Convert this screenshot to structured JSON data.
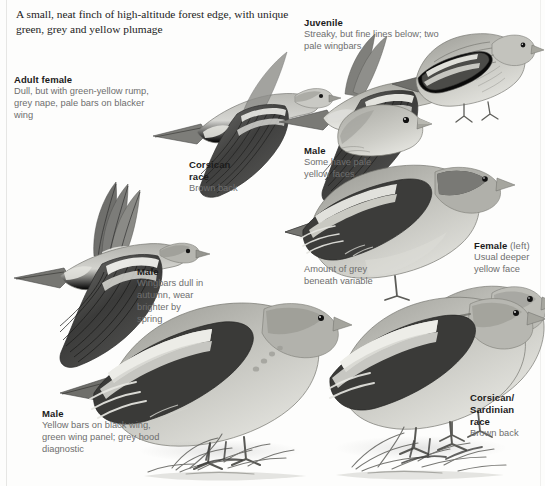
{
  "plate": {
    "title_note": "A small, neat finch of high-altitude forest edge, with unique green, grey and yellow plumage",
    "width": 545,
    "height": 486,
    "background_color": "#fdfdfc",
    "ink_color": "#4a4a4a",
    "label_heading_color": "#1b1b1b",
    "label_body_color": "#6e6e6e"
  },
  "labels": {
    "adult_female": {
      "heading": "Adult female",
      "body": "Dull, but with green-yellow rump, grey nape, pale bars on blacker wing"
    },
    "corsican_race_flight": {
      "heading": "Corsican race",
      "body": "Brown back"
    },
    "male_flight": {
      "heading": "Male",
      "body": "Wingbars dull in autumn, wear brighter by spring"
    },
    "juvenile": {
      "heading": "Juvenile",
      "body": "Streaky, but fine lines below; two pale wingbars"
    },
    "male_head": {
      "heading": "Male",
      "body": "Some have pale yellow faces"
    },
    "female_perched": {
      "heading": "Female",
      "heading_suffix": "(left)",
      "body": "Usual deeper yellow face"
    },
    "grey_note": {
      "body": "Amount of grey beneath variable"
    },
    "male_perched": {
      "heading": "Male",
      "body": "Yellow bars on black wing, green wing panel; grey hood diagnostic"
    },
    "corsican_sardinian_race": {
      "heading": "Corsican/ Sardinian race",
      "body": "Brown back"
    }
  },
  "figures": [
    {
      "id": "flying-adult-female",
      "name": "flying-finch-adult-female"
    },
    {
      "id": "flying-corsican",
      "name": "flying-finch-corsican-race"
    },
    {
      "id": "flying-male",
      "name": "flying-finch-male"
    },
    {
      "id": "juvenile-perched",
      "name": "perched-finch-juvenile"
    },
    {
      "id": "male-head-study",
      "name": "head-study-male"
    },
    {
      "id": "male-perched-upper",
      "name": "perched-finch-male-upper"
    },
    {
      "id": "female-perched",
      "name": "perched-finch-female"
    },
    {
      "id": "male-perched-lower",
      "name": "perched-finch-male-lower"
    },
    {
      "id": "corsican-perched",
      "name": "perched-finch-corsican-sardinian"
    }
  ]
}
